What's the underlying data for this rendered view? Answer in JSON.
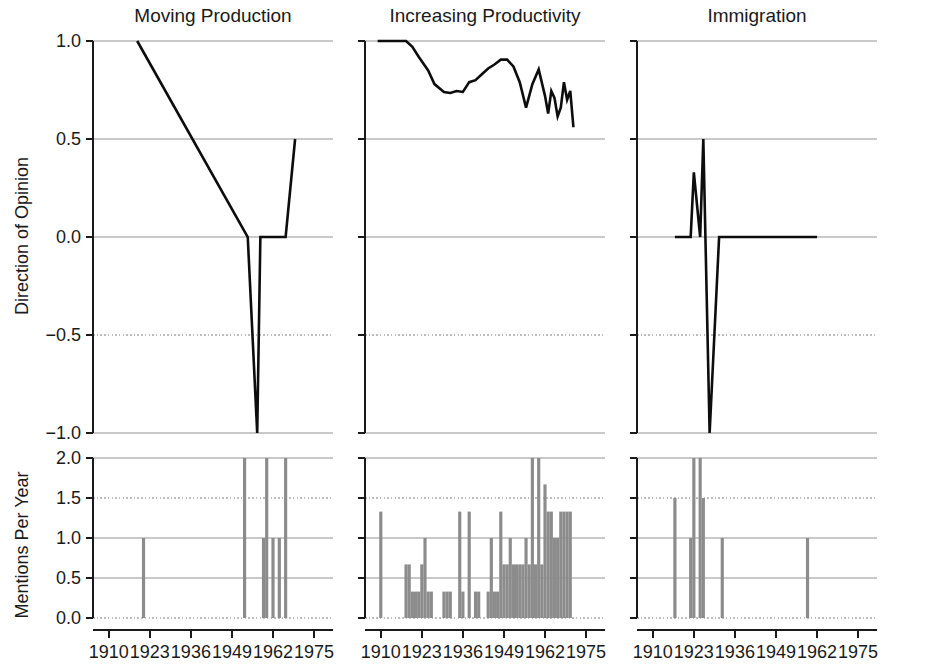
{
  "figure": {
    "width": 932,
    "height": 667,
    "background": "#ffffff",
    "line_color": "#0d0d0d",
    "bar_color": "#8c8c8c",
    "grid_color": "#c9c9c9",
    "axis_color": "#1a1a1a"
  },
  "axes": {
    "top_ylabel": "Direction of Opinion",
    "bottom_ylabel": "Mentions Per Year",
    "top_yticks": [
      "1.0",
      "0.5",
      "0.0",
      "−0.5",
      "−1.0"
    ],
    "top_ytick_values": [
      1.0,
      0.5,
      0.0,
      -0.5,
      -1.0
    ],
    "bottom_yticks": [
      "2.0",
      "1.5",
      "1.0",
      "0.5",
      "0.0"
    ],
    "bottom_ytick_values": [
      2.0,
      1.5,
      1.0,
      0.5,
      0.0
    ],
    "xticks": [
      "1910",
      "1923",
      "1936",
      "1949",
      "1962",
      "1975"
    ],
    "xtick_values": [
      1910,
      1923,
      1936,
      1949,
      1962,
      1975
    ],
    "xlim": [
      1905,
      1981
    ],
    "top_ylim": [
      -1.0,
      1.0
    ],
    "bottom_ylim": [
      0.0,
      2.0
    ],
    "grid": true
  },
  "chart_data": {
    "type": "line",
    "title": "",
    "xlabel": "",
    "ylabel": "Direction of Opinion",
    "ylim": [
      -1.0,
      1.0
    ],
    "xlim": [
      1905,
      1981
    ],
    "panels": [
      {
        "title": "Moving Production",
        "opinion": {
          "type": "line",
          "x": [
            1919,
            1954,
            1957,
            1958,
            1964,
            1966,
            1969
          ],
          "y": [
            1.0,
            0.0,
            -1.0,
            0.0,
            0.0,
            0.0,
            0.5
          ]
        },
        "mentions": {
          "type": "bar",
          "x": [
            1921,
            1953,
            1959,
            1960,
            1962,
            1964,
            1966
          ],
          "y": [
            1.0,
            2.0,
            1.0,
            2.0,
            1.0,
            1.0,
            2.0
          ]
        }
      },
      {
        "title": "Increasing Productivity",
        "opinion": {
          "type": "line",
          "x": [
            1909,
            1918,
            1920,
            1922,
            1925,
            1927,
            1930,
            1932,
            1934,
            1936,
            1938,
            1940,
            1942,
            1944,
            1946,
            1948,
            1950,
            1952,
            1954,
            1956,
            1958,
            1960,
            1962,
            1963,
            1964,
            1965,
            1966,
            1967,
            1968,
            1969,
            1970,
            1971
          ],
          "y": [
            1.0,
            1.0,
            0.97,
            0.92,
            0.85,
            0.78,
            0.74,
            0.735,
            0.745,
            0.74,
            0.79,
            0.8,
            0.83,
            0.86,
            0.88,
            0.905,
            0.905,
            0.87,
            0.79,
            0.66,
            0.78,
            0.855,
            0.72,
            0.63,
            0.745,
            0.71,
            0.615,
            0.66,
            0.79,
            0.7,
            0.745,
            0.56
          ]
        },
        "mentions": {
          "type": "bar",
          "x": [
            1910,
            1918,
            1919,
            1920,
            1921,
            1922,
            1923,
            1924,
            1925,
            1926,
            1930,
            1931,
            1932,
            1935,
            1936,
            1937,
            1938,
            1940,
            1941,
            1944,
            1945,
            1946,
            1947,
            1948,
            1949,
            1950,
            1951,
            1952,
            1953,
            1954,
            1955,
            1956,
            1957,
            1958,
            1959,
            1960,
            1961,
            1962,
            1963,
            1964,
            1965,
            1966,
            1967,
            1968,
            1969,
            1970,
            1971
          ],
          "y": [
            1.33,
            0.67,
            0.67,
            0.33,
            0.33,
            0.33,
            0.67,
            1.0,
            0.33,
            0.33,
            0.33,
            0.33,
            0.33,
            1.33,
            0.33,
            0.0,
            1.33,
            0.33,
            0.33,
            0.33,
            1.0,
            0.33,
            0.33,
            1.33,
            0.67,
            0.67,
            1.0,
            0.67,
            0.67,
            0.67,
            0.67,
            1.0,
            0.67,
            2.0,
            0.67,
            2.0,
            0.67,
            1.67,
            1.33,
            1.33,
            1.0,
            1.0,
            1.33,
            1.33,
            1.33,
            1.33,
            0.0
          ]
        }
      },
      {
        "title": "Immigration",
        "opinion": {
          "type": "line",
          "x": [
            1917,
            1922,
            1923,
            1925,
            1926,
            1928,
            1931,
            1937,
            1962
          ],
          "y": [
            0.0,
            0.0,
            0.33,
            0.0,
            0.5,
            -1.0,
            0.0,
            0.0,
            0.0
          ]
        },
        "mentions": {
          "type": "bar",
          "x": [
            1917,
            1922,
            1923,
            1925,
            1926,
            1932,
            1959
          ],
          "y": [
            1.5,
            1.0,
            2.0,
            2.0,
            1.5,
            1.0,
            1.0
          ]
        }
      }
    ]
  }
}
